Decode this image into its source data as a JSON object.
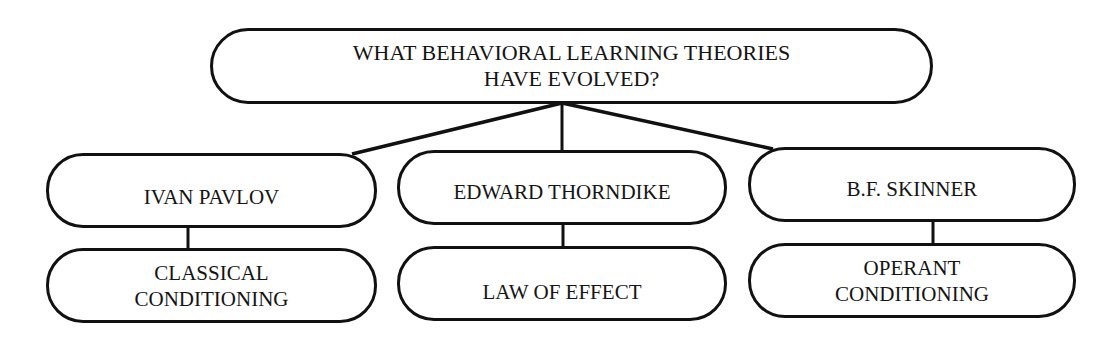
{
  "diagram": {
    "type": "hierarchy",
    "colors": {
      "line": "#111111",
      "text": "#141414",
      "background": "#ffffff"
    },
    "root": {
      "line1": "WHAT BEHAVIORAL LEARNING THEORIES",
      "line2": "HAVE EVOLVED?"
    },
    "branches": [
      {
        "theorist": "IVAN PAVLOV",
        "theory_line1": "CLASSICAL",
        "theory_line2": "CONDITIONING"
      },
      {
        "theorist": "EDWARD THORNDIKE",
        "theory_line1": "LAW OF EFFECT"
      },
      {
        "theorist": "B.F. SKINNER",
        "theory_line1": "OPERANT",
        "theory_line2": "CONDITIONING"
      }
    ]
  }
}
